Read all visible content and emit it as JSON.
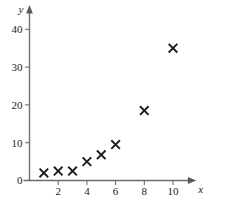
{
  "chart_data": {
    "type": "scatter",
    "title": "",
    "xlabel": "x",
    "ylabel": "y",
    "xlim": [
      0,
      11
    ],
    "ylim": [
      0,
      43
    ],
    "grid": false,
    "legend": null,
    "marker": "x-cross",
    "marker_color": "#1d1d1d",
    "x": [
      1,
      2,
      3,
      4,
      5,
      6,
      8,
      10
    ],
    "y": [
      2,
      2.5,
      2.5,
      5,
      6.8,
      9.5,
      18.5,
      35
    ],
    "points": [
      {
        "x": 1,
        "y": 2
      },
      {
        "x": 2,
        "y": 2.5
      },
      {
        "x": 3,
        "y": 2.5
      },
      {
        "x": 4,
        "y": 5
      },
      {
        "x": 5,
        "y": 6.8
      },
      {
        "x": 6,
        "y": 9.5
      },
      {
        "x": 8,
        "y": 18.5
      },
      {
        "x": 10,
        "y": 35
      }
    ],
    "xticks": [
      2,
      4,
      6,
      8,
      10
    ],
    "xtick_labels": [
      "2",
      "4",
      "6",
      "8",
      "10"
    ],
    "yticks": [
      0,
      10,
      20,
      30,
      40
    ],
    "ytick_labels": [
      "0",
      "10",
      "20",
      "30",
      "40"
    ],
    "axis_color": "#6e6e6e"
  },
  "axes": {
    "x_axis_label": "x",
    "y_axis_label": "y",
    "origin_label": "0"
  }
}
